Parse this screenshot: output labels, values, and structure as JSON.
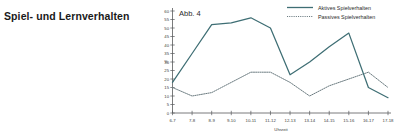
{
  "section": {
    "heading": "Spiel- und Lernverhalten"
  },
  "chart_data": {
    "type": "line",
    "title": "Abb. 4",
    "xlabel": "Uhrzeit",
    "ylabel": "%",
    "ylim": [
      0,
      60
    ],
    "yticks": [
      0,
      5,
      10,
      15,
      20,
      25,
      30,
      35,
      40,
      45,
      50,
      55,
      60
    ],
    "grid": false,
    "legend_position": "top-right",
    "categories": [
      "6-7",
      "7-8",
      "8-9",
      "9-10",
      "10-11",
      "11-12",
      "12-13",
      "13-14",
      "14-15",
      "15-16",
      "16-17",
      "17-18"
    ],
    "series": [
      {
        "name": "Aktives Spielverhalten",
        "style": "solid",
        "color": "#3e6e74",
        "values": [
          18,
          35,
          52,
          53,
          56,
          50,
          22.5,
          30,
          39,
          47,
          15,
          9
        ]
      },
      {
        "name": "Passives Spielverhalten",
        "style": "dotted",
        "color": "#6b7b80",
        "values": [
          15,
          10,
          12,
          18,
          24,
          24,
          18,
          10,
          16,
          20,
          24,
          15
        ]
      }
    ]
  }
}
